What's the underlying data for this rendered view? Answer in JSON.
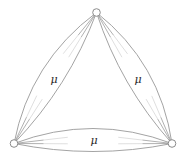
{
  "figure": {
    "type": "triangle-multigraph",
    "background": "#ffffff",
    "edge_color": "#999999",
    "edge_width": 0.9,
    "node_fill": "#ffffff",
    "node_stroke": "#8c8c8c",
    "node_stroke_width": 1,
    "node_radius": 3.8,
    "label_color": "#2b2b2b",
    "label_font_size": 11,
    "nodes": [
      {
        "id": "top",
        "x": 96.5,
        "y": 12.5
      },
      {
        "id": "bottom-left",
        "x": 14,
        "y": 143.5
      },
      {
        "id": "bottom-right",
        "x": 172,
        "y": 143.5
      }
    ],
    "edges": [
      {
        "from": "top",
        "to": "bottom-left",
        "label": "μ",
        "label_x": 54,
        "label_y": 80,
        "bulge_a": 15,
        "bulge_b": -8,
        "stubs": 2
      },
      {
        "from": "top",
        "to": "bottom-right",
        "label": "μ",
        "label_x": 138,
        "label_y": 80,
        "bulge_a": -15,
        "bulge_b": 8,
        "stubs": 2
      },
      {
        "from": "bottom-left",
        "to": "bottom-right",
        "label": "μ",
        "label_x": 94,
        "label_y": 141,
        "bulge_a": -15,
        "bulge_b": 8,
        "stubs": 2
      }
    ]
  }
}
